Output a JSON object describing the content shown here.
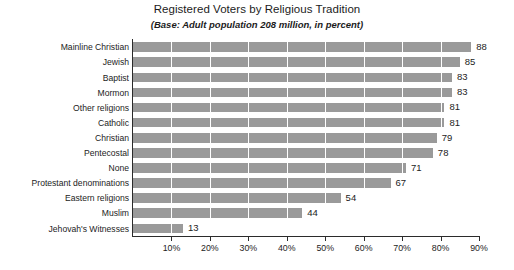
{
  "chart_data": {
    "type": "bar",
    "orientation": "horizontal",
    "title": "Registered Voters by Religious Tradition",
    "subtitle": "(Base: Adult population 208 million, in percent)",
    "xlabel": "",
    "ylabel": "",
    "xlim": [
      0,
      90
    ],
    "grid": true,
    "legend": null,
    "bar_color": "#9a9a9a",
    "axis_color": "#2b2b2b",
    "background_color": "#ffffff",
    "tick_labels": [
      "10%",
      "20%",
      "30%",
      "40%",
      "50%",
      "60%",
      "70%",
      "80%",
      "90%"
    ],
    "tick_values": [
      10,
      20,
      30,
      40,
      50,
      60,
      70,
      80,
      90
    ],
    "categories": [
      "Mainline Christian",
      "Jewish",
      "Baptist",
      "Mormon",
      "Other religions",
      "Catholic",
      "Christian",
      "Pentecostal",
      "None",
      "Protestant denominations",
      "Eastern religions",
      "Muslim",
      "Jehovah's Witnesses"
    ],
    "values": [
      88,
      85,
      83,
      83,
      81,
      81,
      79,
      78,
      71,
      67,
      54,
      44,
      13
    ],
    "value_labels": [
      "88",
      "85",
      "83",
      "83",
      "81",
      "81",
      "79",
      "78",
      "71",
      "67",
      "54",
      "44",
      "13"
    ]
  }
}
